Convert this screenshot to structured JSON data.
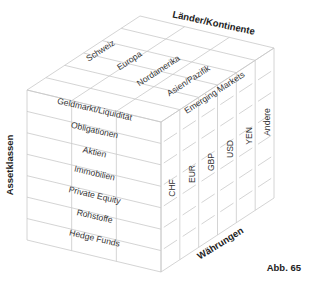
{
  "diagram": {
    "type": "3d-cube-matrix",
    "axes": {
      "vertical": "Assetklassen",
      "depth": "Länder/Kontinente",
      "horizontal": "Währungen"
    },
    "asset_classes": [
      "Geldmarkt/Liquidität",
      "Obligationen",
      "Aktien",
      "Immobilien",
      "Private Equity",
      "Rohstoffe",
      "Hedge Funds"
    ],
    "regions": [
      "Schweiz",
      "Europa",
      "Nordamerika",
      "Asien/Pazifik",
      "Emerging Markets"
    ],
    "currencies": [
      "CHF",
      "EUR",
      "GBP",
      "USD",
      "YEN",
      "Andere"
    ]
  },
  "caption": "Abb. 65",
  "colors": {
    "grid": "#c9c9c9",
    "text": "#333333",
    "background": "#ffffff"
  }
}
